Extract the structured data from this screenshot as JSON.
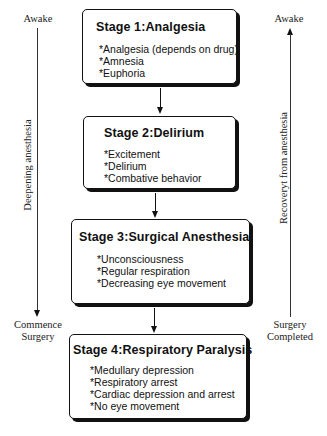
{
  "left_axis": {
    "top_label": "Awake",
    "rotated_label": "Deepening anesthesia",
    "bottom_label_line1": "Commence",
    "bottom_label_line2": "Surgery",
    "direction": "down"
  },
  "right_axis": {
    "top_label": "Awake",
    "rotated_label": "Recoveryt from anesthesia",
    "bottom_label_line1": "Surgery",
    "bottom_label_line2": "Completed",
    "direction": "up"
  },
  "stages": [
    {
      "title": "Stage 1:Analgesia",
      "items": [
        "*Analgesia (depends on drug)",
        "*Amnesia",
        "*Euphoria"
      ]
    },
    {
      "title": "Stage 2:Delirium",
      "items": [
        "*Excitement",
        "*Delirium",
        "*Combative behavior"
      ]
    },
    {
      "title": "Stage 3:Surgical Anesthesia",
      "items": [
        "*Unconsciousness",
        "*Regular respiration",
        "*Decreasing eye movement"
      ]
    },
    {
      "title": "Stage 4:Respiratory Paralysis",
      "items": [
        "*Medullary depression",
        "*Respiratory arrest",
        "*Cardiac depression and arrest",
        "*No eye movement"
      ]
    }
  ],
  "colors": {
    "line": "#111111",
    "background": "#ffffff",
    "box_border": "#111111"
  }
}
